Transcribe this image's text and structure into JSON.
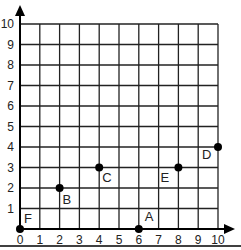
{
  "chart_data": {
    "type": "scatter",
    "title": "",
    "xlabel": "",
    "ylabel": "",
    "xlim": [
      0,
      10
    ],
    "ylim": [
      0,
      10
    ],
    "grid": true,
    "x_ticks": [
      "0",
      "1",
      "2",
      "3",
      "4",
      "5",
      "6",
      "7",
      "8",
      "9",
      "10"
    ],
    "y_ticks": [
      "1",
      "2",
      "3",
      "4",
      "5",
      "6",
      "7",
      "8",
      "9",
      "10"
    ],
    "points": [
      {
        "label": "A",
        "x": 6,
        "y": 0
      },
      {
        "label": "B",
        "x": 2,
        "y": 2
      },
      {
        "label": "C",
        "x": 4,
        "y": 3
      },
      {
        "label": "D",
        "x": 10,
        "y": 4
      },
      {
        "label": "E",
        "x": 8,
        "y": 3
      },
      {
        "label": "F",
        "x": 0,
        "y": 0
      }
    ]
  },
  "style": {
    "grid_color": "#222222",
    "point_color": "#000000"
  }
}
